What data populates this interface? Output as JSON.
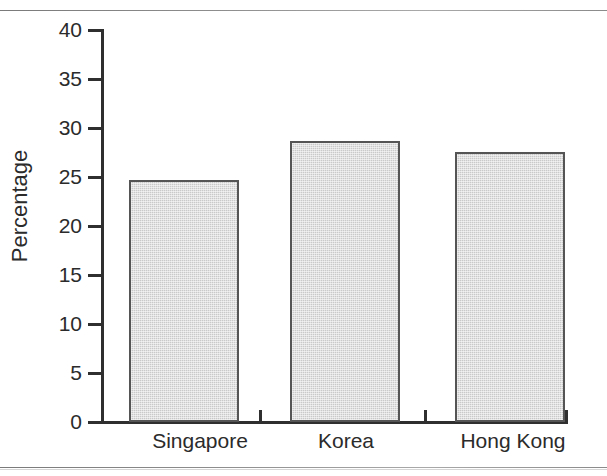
{
  "chart_data": {
    "type": "bar",
    "title": "",
    "xlabel": "",
    "ylabel": "Percentage",
    "categories": [
      "Singapore",
      "Korea",
      "Hong Kong"
    ],
    "values": [
      24.7,
      28.7,
      27.6
    ],
    "ylim": [
      0,
      40
    ],
    "yticks": [
      0,
      5,
      10,
      15,
      20,
      25,
      30,
      35,
      40
    ],
    "ytick_labels": [
      "0",
      "5",
      "10",
      "15",
      "20",
      "25",
      "30",
      "35",
      "40"
    ],
    "grid": false,
    "legend": null,
    "series": [
      {
        "name": "Percentage",
        "values": [
          24.7,
          28.7,
          27.6
        ],
        "color": "#c9c9c9",
        "edge_color": "#555555"
      }
    ],
    "colors": {
      "bar_fill": "#c9c9c9",
      "bar_edge": "#555555",
      "axis": "#2f2f2f",
      "text": "#2b2b2b",
      "background": "#ffffff",
      "rule": "#8a8a8a"
    }
  },
  "axis": {
    "y_title": "Percentage",
    "ticks": [
      {
        "label": "40",
        "value": 40
      },
      {
        "label": "35",
        "value": 35
      },
      {
        "label": "30",
        "value": 30
      },
      {
        "label": "25",
        "value": 25
      },
      {
        "label": "20",
        "value": 20
      },
      {
        "label": "15",
        "value": 15
      },
      {
        "label": "10",
        "value": 10
      },
      {
        "label": "5",
        "value": 5
      },
      {
        "label": "0",
        "value": 0
      }
    ]
  },
  "bars": [
    {
      "label": "Singapore",
      "value": 24.7
    },
    {
      "label": "Korea",
      "value": 28.7
    },
    {
      "label": "Hong Kong",
      "value": 27.6
    }
  ]
}
